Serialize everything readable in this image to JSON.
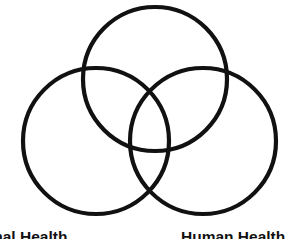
{
  "diagram": {
    "type": "venn",
    "stroke_color": "#111111",
    "background": "#ffffff",
    "circles": [
      {
        "name": "top",
        "cx": 155,
        "cy": 79,
        "r": 72
      },
      {
        "name": "left",
        "cx": 96,
        "cy": 141,
        "r": 73
      },
      {
        "name": "right",
        "cx": 203,
        "cy": 141,
        "r": 73
      }
    ],
    "labels": {
      "left": "Animal Health",
      "right": "Human Health"
    }
  }
}
